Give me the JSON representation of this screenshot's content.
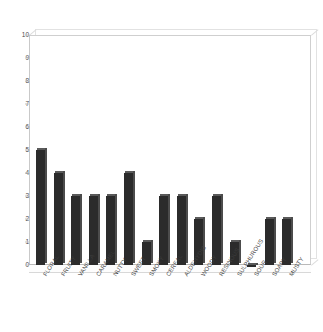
{
  "chart_data": {
    "type": "bar",
    "title": "",
    "subtitle": "",
    "xlabel": "",
    "ylabel": "",
    "ylim": [
      0,
      10
    ],
    "yticks": [
      0,
      1,
      2,
      3,
      4,
      5,
      6,
      7,
      8,
      9,
      10
    ],
    "grid": false,
    "legend": null,
    "style": "3d-column",
    "bar_color": "#2b2b2b",
    "categories": [
      "FLORAL",
      "FRUITY",
      "VANILLA",
      "CARAMEL",
      "NUTTY",
      "SWEET",
      "SMOKY",
      "CEREAL",
      "ALDEHYDIC",
      "WOODY",
      "RESINOUS",
      "SULPHUROUS",
      "SOUR",
      "SOAPY",
      "MUSTY"
    ],
    "values": [
      5,
      4,
      3,
      3,
      3,
      4,
      1,
      3,
      3,
      2,
      3,
      1,
      0,
      2,
      2
    ]
  }
}
